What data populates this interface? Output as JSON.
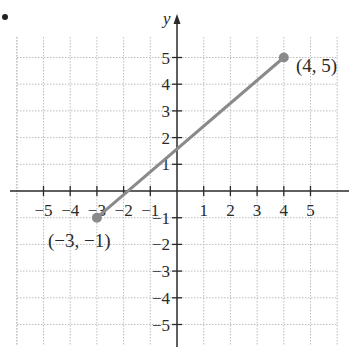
{
  "chart_data": {
    "type": "line",
    "title": "",
    "xlabel": "",
    "ylabel": "y",
    "xlim": [
      -6,
      6
    ],
    "ylim": [
      -6,
      6
    ],
    "grid": true,
    "x_ticks": [
      -5,
      -4,
      -3,
      -2,
      -1,
      1,
      2,
      3,
      4,
      5
    ],
    "x_tick_labels": [
      "−5",
      "−4",
      "−3",
      "−2",
      "−1",
      "1",
      "2",
      "3",
      "4",
      "5"
    ],
    "y_ticks": [
      -5,
      -4,
      -3,
      -2,
      -1,
      1,
      2,
      3,
      4,
      5
    ],
    "y_tick_labels": [
      "−5",
      "−4",
      "−3",
      "−2",
      "−1",
      "1",
      "2",
      "3",
      "4",
      "5"
    ],
    "series": [
      {
        "name": "segment",
        "x": [
          -3,
          4
        ],
        "y": [
          -1,
          5
        ],
        "color": "#8a8a8a"
      }
    ],
    "annotations": [
      {
        "text": "(−3, −1)",
        "x": -3,
        "y": -1
      },
      {
        "text": "(4, 5)",
        "x": 4,
        "y": 5
      }
    ]
  },
  "labels": {
    "y_axis": "y",
    "point_a": "(−3, −1)",
    "point_b": "(4, 5)"
  },
  "colors": {
    "axis": "#2a2a2a",
    "grid": "#bdbdbd",
    "segment": "#8a8a8a",
    "point": "#8a8a8a"
  }
}
